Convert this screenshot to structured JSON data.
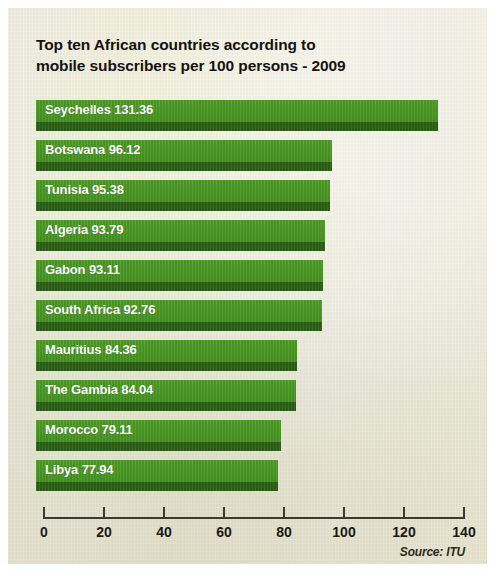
{
  "title": {
    "line1": "Top ten African countries according to",
    "line2": "mobile subscribers per 100 persons - 2009"
  },
  "source": "Source: ITU",
  "colors": {
    "bar_light": "#4e9f27",
    "bar_dark": "#2c6015",
    "panel_background": "#edecd4",
    "label_text": "#ffffff",
    "axis": "#3a3a33"
  },
  "chart_data": {
    "type": "bar",
    "orientation": "horizontal",
    "title": "Top ten African countries according to mobile subscribers per 100 persons - 2009",
    "xlabel": "",
    "ylabel": "",
    "xlim": [
      0,
      140
    ],
    "xticks": [
      0,
      20,
      40,
      60,
      80,
      100,
      120,
      140
    ],
    "grid": false,
    "legend": false,
    "source": "Source: ITU",
    "categories": [
      "Seychelles",
      "Botswana",
      "Tunisia",
      "Algeria",
      "Gabon",
      "South Africa",
      "Mauritius",
      "The Gambia",
      "Morocco",
      "Libya"
    ],
    "values": [
      131.36,
      96.12,
      95.38,
      93.79,
      93.11,
      92.76,
      84.36,
      84.04,
      79.11,
      77.94
    ],
    "bar_labels": [
      "Seychelles 131.36",
      "Botswana 96.12",
      "Tunisia 95.38",
      "Algeria 93.79",
      "Gabon 93.11",
      "South Africa 92.76",
      "Mauritius 84.36",
      "The Gambia 84.04",
      "Morocco 79.11",
      "Libya 77.94"
    ]
  }
}
